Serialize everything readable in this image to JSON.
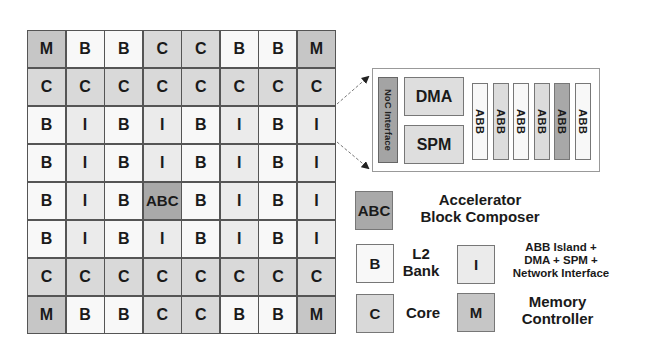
{
  "grid": {
    "rows": [
      [
        "M",
        "B",
        "B",
        "C",
        "C",
        "B",
        "B",
        "M"
      ],
      [
        "C",
        "C",
        "C",
        "C",
        "C",
        "C",
        "C",
        "C"
      ],
      [
        "B",
        "I",
        "B",
        "I",
        "B",
        "I",
        "B",
        "I"
      ],
      [
        "B",
        "I",
        "B",
        "I",
        "B",
        "I",
        "B",
        "I"
      ],
      [
        "B",
        "I",
        "B",
        "ABC",
        "B",
        "I",
        "B",
        "I"
      ],
      [
        "B",
        "I",
        "B",
        "I",
        "B",
        "I",
        "B",
        "I"
      ],
      [
        "C",
        "C",
        "C",
        "C",
        "C",
        "C",
        "C",
        "C"
      ],
      [
        "M",
        "B",
        "B",
        "C",
        "C",
        "B",
        "B",
        "M"
      ]
    ]
  },
  "detail": {
    "noc_label": "NoC Interface",
    "dma_label": "DMA",
    "spm_label": "SPM",
    "abb_blocks": [
      {
        "label": "ABB",
        "shade": "#f8f8f8"
      },
      {
        "label": "ABB",
        "shade": "#dcdcdc"
      },
      {
        "label": "ABB",
        "shade": "#f8f8f8"
      },
      {
        "label": "ABB",
        "shade": "#dcdcdc"
      },
      {
        "label": "ABB",
        "shade": "#a8a8a8"
      },
      {
        "label": "ABB",
        "shade": "#f8f8f8"
      }
    ]
  },
  "legend": {
    "abc": {
      "symbol": "ABC",
      "line1": "Accelerator",
      "line2": "Block Composer"
    },
    "b": {
      "symbol": "B",
      "line1": "L2",
      "line2": "Bank"
    },
    "i": {
      "symbol": "I",
      "line1": "ABB Island +",
      "line2": "DMA + SPM +",
      "line3": "Network Interface"
    },
    "c": {
      "symbol": "C",
      "line1": "Core"
    },
    "m": {
      "symbol": "M",
      "line1": "Memory",
      "line2": "Controller"
    }
  },
  "colors": {
    "memory_controller": "#c6c6c6",
    "core": "#d9d9d9",
    "l2_bank": "#f8f8f8",
    "island": "#ebebeb",
    "abc": "#a9a9a9",
    "noc": "#a4a4a4"
  }
}
